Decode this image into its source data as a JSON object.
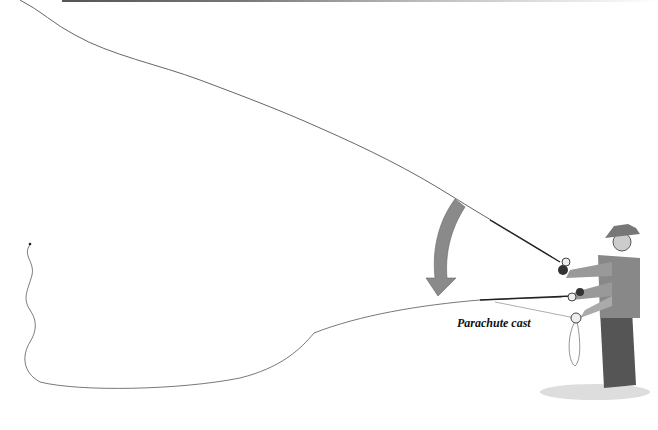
{
  "figure": {
    "caption": "Parachute cast",
    "arrow_color": "#8a8a8a",
    "line_color": "#444444"
  }
}
